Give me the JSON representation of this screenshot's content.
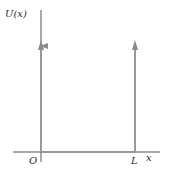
{
  "diagram": {
    "y_axis_label": "U(x)",
    "x_axis_label": "x",
    "origin_label": "O",
    "well_width_label": "L",
    "colors": {
      "axes": "#555555",
      "walls": "#999999",
      "text": "#2b2b2b"
    }
  }
}
